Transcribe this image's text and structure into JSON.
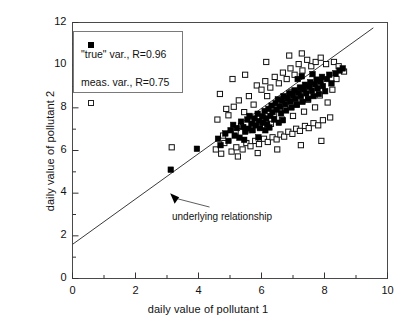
{
  "chart_data": {
    "type": "scatter",
    "title": "",
    "xlabel": "daily value of pollutant 1",
    "ylabel": "daily value of pollutant 2",
    "xlim": [
      0,
      10
    ],
    "ylim": [
      0,
      12
    ],
    "xticks": [
      0,
      2,
      4,
      6,
      8,
      10
    ],
    "yticks": [
      0,
      2,
      4,
      6,
      8,
      10,
      12
    ],
    "xtick_labels": [
      "0",
      "2",
      "4",
      "6",
      "8",
      "10"
    ],
    "ytick_labels": [
      "0",
      "2",
      "4",
      "6",
      "8",
      "10",
      "12"
    ],
    "x_minor_ticks": [
      1,
      3,
      5,
      7,
      9
    ],
    "y_minor_ticks": [
      1,
      3,
      5,
      7,
      9,
      11
    ],
    "grid": false,
    "legend_position": "upper-left",
    "legend": [
      {
        "marker": "filled-square",
        "label": "\"true\" var., R=0.96"
      },
      {
        "marker": "open-square",
        "label": "meas. var., R=0.75"
      }
    ],
    "annotations": [
      {
        "text": "underlying relationship",
        "x": 4.35,
        "y": 3.35,
        "arrow_to_x": 3.1,
        "arrow_to_y": 4.0
      }
    ],
    "reference_line": {
      "label": "underlying relationship",
      "x_start": 0.0,
      "y_start": 1.6,
      "x_end": 9.55,
      "y_end": 11.75,
      "slope": 1.063,
      "intercept": 1.6
    },
    "series": [
      {
        "name": "\"true\" var., R=0.96",
        "marker": "filled-square",
        "R": 0.96,
        "points": [
          [
            3.12,
            5.1
          ],
          [
            3.95,
            6.08
          ],
          [
            4.62,
            6.55
          ],
          [
            4.7,
            6.25
          ],
          [
            4.85,
            6.8
          ],
          [
            4.95,
            6.45
          ],
          [
            5.02,
            6.95
          ],
          [
            5.1,
            7.2
          ],
          [
            5.15,
            6.7
          ],
          [
            5.22,
            7.05
          ],
          [
            5.3,
            6.6
          ],
          [
            5.35,
            7.35
          ],
          [
            5.42,
            7.1
          ],
          [
            5.48,
            6.88
          ],
          [
            5.55,
            7.45
          ],
          [
            5.58,
            7.02
          ],
          [
            5.62,
            7.62
          ],
          [
            5.68,
            7.25
          ],
          [
            5.72,
            6.95
          ],
          [
            5.78,
            7.5
          ],
          [
            5.82,
            7.18
          ],
          [
            5.88,
            7.72
          ],
          [
            5.92,
            7.38
          ],
          [
            5.95,
            7.05
          ],
          [
            6.02,
            7.6
          ],
          [
            6.05,
            7.3
          ],
          [
            6.1,
            7.85
          ],
          [
            6.15,
            7.5
          ],
          [
            6.18,
            7.22
          ],
          [
            6.22,
            7.95
          ],
          [
            6.28,
            7.62
          ],
          [
            6.32,
            8.1
          ],
          [
            6.35,
            7.8
          ],
          [
            6.4,
            7.45
          ],
          [
            6.45,
            8.22
          ],
          [
            6.48,
            7.92
          ],
          [
            6.52,
            8.4
          ],
          [
            6.58,
            8.05
          ],
          [
            6.62,
            7.75
          ],
          [
            6.65,
            8.32
          ],
          [
            6.7,
            8.55
          ],
          [
            6.75,
            8.18
          ],
          [
            6.78,
            7.88
          ],
          [
            6.82,
            8.45
          ],
          [
            6.88,
            8.68
          ],
          [
            6.92,
            8.3
          ],
          [
            6.95,
            8.02
          ],
          [
            7.0,
            8.58
          ],
          [
            7.05,
            8.82
          ],
          [
            7.08,
            8.42
          ],
          [
            7.12,
            8.15
          ],
          [
            7.18,
            8.7
          ],
          [
            7.22,
            8.95
          ],
          [
            7.25,
            8.55
          ],
          [
            7.3,
            8.28
          ],
          [
            7.35,
            8.85
          ],
          [
            7.38,
            9.08
          ],
          [
            7.42,
            8.68
          ],
          [
            7.48,
            8.42
          ],
          [
            7.52,
            8.98
          ],
          [
            7.55,
            9.2
          ],
          [
            7.6,
            8.8
          ],
          [
            7.65,
            8.55
          ],
          [
            7.7,
            9.1
          ],
          [
            7.75,
            9.32
          ],
          [
            7.78,
            8.92
          ],
          [
            7.82,
            8.65
          ],
          [
            7.88,
            9.22
          ],
          [
            7.92,
            9.45
          ],
          [
            7.95,
            9.02
          ],
          [
            8.02,
            8.78
          ],
          [
            8.08,
            9.35
          ],
          [
            8.15,
            9.55
          ],
          [
            8.22,
            9.15
          ],
          [
            8.35,
            9.62
          ],
          [
            8.48,
            9.75
          ],
          [
            8.58,
            9.85
          ],
          [
            6.12,
            6.95
          ],
          [
            6.25,
            7.08
          ],
          [
            5.45,
            6.5
          ],
          [
            7.15,
            9.35
          ],
          [
            7.62,
            9.58
          ],
          [
            6.55,
            7.3
          ],
          [
            5.9,
            6.62
          ],
          [
            6.68,
            7.42
          ],
          [
            7.28,
            9.48
          ]
        ]
      },
      {
        "name": "meas. var., R=0.75",
        "marker": "open-square",
        "R": 0.75,
        "points": [
          [
            3.15,
            6.15
          ],
          [
            4.55,
            6.05
          ],
          [
            4.6,
            7.45
          ],
          [
            4.72,
            5.85
          ],
          [
            4.88,
            7.95
          ],
          [
            5.05,
            5.95
          ],
          [
            5.12,
            8.05
          ],
          [
            5.2,
            6.15
          ],
          [
            5.28,
            8.35
          ],
          [
            5.4,
            6.05
          ],
          [
            5.45,
            7.8
          ],
          [
            5.52,
            6.35
          ],
          [
            5.6,
            8.55
          ],
          [
            5.65,
            6.2
          ],
          [
            5.75,
            8.15
          ],
          [
            5.8,
            6.45
          ],
          [
            5.85,
            9.05
          ],
          [
            5.92,
            6.3
          ],
          [
            6.0,
            8.85
          ],
          [
            6.08,
            6.55
          ],
          [
            6.12,
            9.25
          ],
          [
            6.2,
            6.4
          ],
          [
            6.28,
            8.95
          ],
          [
            6.35,
            6.62
          ],
          [
            6.42,
            9.45
          ],
          [
            6.48,
            6.52
          ],
          [
            6.55,
            9.15
          ],
          [
            6.6,
            6.75
          ],
          [
            6.68,
            9.65
          ],
          [
            6.72,
            6.65
          ],
          [
            6.8,
            9.35
          ],
          [
            6.85,
            6.88
          ],
          [
            6.92,
            9.85
          ],
          [
            6.98,
            6.78
          ],
          [
            7.05,
            9.55
          ],
          [
            7.1,
            7.02
          ],
          [
            7.18,
            10.05
          ],
          [
            7.22,
            6.92
          ],
          [
            7.3,
            9.75
          ],
          [
            7.38,
            7.15
          ],
          [
            7.45,
            10.25
          ],
          [
            7.5,
            7.05
          ],
          [
            7.58,
            9.95
          ],
          [
            7.65,
            7.28
          ],
          [
            7.72,
            10.15
          ],
          [
            7.8,
            7.18
          ],
          [
            7.88,
            10.35
          ],
          [
            7.95,
            7.42
          ],
          [
            8.05,
            10.05
          ],
          [
            8.18,
            7.55
          ],
          [
            8.3,
            10.15
          ],
          [
            8.45,
            9.95
          ],
          [
            8.62,
            9.7
          ],
          [
            4.95,
            7.65
          ],
          [
            5.35,
            7.15
          ],
          [
            5.7,
            7.35
          ],
          [
            6.05,
            7.55
          ],
          [
            6.4,
            7.72
          ],
          [
            6.75,
            7.95
          ],
          [
            7.12,
            8.15
          ],
          [
            7.48,
            8.38
          ],
          [
            7.85,
            8.58
          ],
          [
            4.78,
            6.7
          ],
          [
            5.18,
            6.85
          ],
          [
            5.55,
            6.95
          ],
          [
            5.95,
            7.1
          ],
          [
            6.3,
            7.25
          ],
          [
            6.65,
            7.45
          ],
          [
            7.0,
            7.62
          ],
          [
            7.35,
            7.82
          ],
          [
            7.7,
            8.02
          ],
          [
            8.1,
            8.25
          ],
          [
            5.08,
            9.35
          ],
          [
            5.48,
            9.55
          ],
          [
            6.15,
            10.15
          ],
          [
            6.88,
            10.45
          ],
          [
            7.28,
            10.55
          ],
          [
            4.68,
            8.65
          ],
          [
            5.25,
            5.72
          ],
          [
            5.88,
            5.88
          ],
          [
            6.5,
            6.05
          ],
          [
            7.25,
            6.25
          ],
          [
            7.9,
            6.45
          ],
          [
            8.25,
            8.85
          ],
          [
            8.38,
            9.35
          ],
          [
            4.82,
            6.35
          ],
          [
            6.18,
            8.55
          ],
          [
            6.95,
            8.75
          ]
        ]
      }
    ]
  }
}
